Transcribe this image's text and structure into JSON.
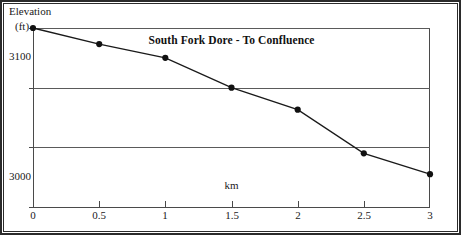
{
  "figure": {
    "y_axis_title_line1": "Elevation",
    "y_axis_title_line2": "(ft)"
  },
  "chart_data": {
    "type": "line",
    "title": "South Fork Dore - To Confluence",
    "xlabel": "km",
    "ylabel": "Elevation (ft)",
    "x": [
      0,
      0.5,
      1,
      1.5,
      2,
      2.5,
      3
    ],
    "values": [
      3100,
      3073,
      3050,
      3000,
      2963,
      2890,
      2855
    ],
    "series": [
      {
        "name": "South Fork Dore profile",
        "values": [
          3100,
          3073,
          3050,
          3000,
          2963,
          2890,
          2855
        ]
      }
    ],
    "xlim": [
      0,
      3
    ],
    "ylim": [
      2800,
      3100
    ],
    "xticks": [
      0,
      0.5,
      1,
      1.5,
      2,
      2.5,
      3
    ],
    "xtick_labels": [
      "0",
      "0.5",
      "1",
      "1.5",
      "2",
      "2.5",
      "3"
    ],
    "yticks": [
      2800,
      2900,
      3000,
      3100
    ],
    "ytick_labels": [
      "2800",
      "2900",
      "3000",
      "3100"
    ],
    "grid": true,
    "grid_axis": "y",
    "legend": false,
    "marker": "filled-circle",
    "line_color": "#1a1a1a",
    "marker_color": "#111111",
    "grid_color": "#5a5a5a",
    "axis_color": "#4a4a4a",
    "background_color": "#ffffff"
  }
}
